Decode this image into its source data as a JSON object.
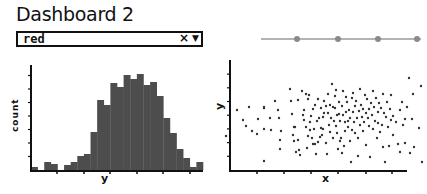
{
  "header": {
    "title": "Dashboard 2"
  },
  "controls": {
    "dropdown": {
      "value": "red",
      "clear_icon": "×",
      "caret_icon": "▼"
    },
    "slider": {
      "label": "",
      "ticks": 4,
      "value_index": 3,
      "accent": "#8a8a8a"
    }
  },
  "colors": {
    "bar": "#4d4d4d",
    "axis": "#111111",
    "point": "#333333"
  },
  "chart_data": [
    {
      "type": "bar",
      "title": "",
      "xlabel": "y",
      "ylabel": "count",
      "grid": false,
      "values": [
        3,
        0,
        8,
        6,
        0,
        5,
        8,
        14,
        16,
        38,
        70,
        65,
        87,
        83,
        95,
        91,
        96,
        85,
        88,
        74,
        52,
        37,
        21,
        12,
        3,
        8
      ]
    },
    {
      "type": "scatter",
      "title": "",
      "xlabel": "x",
      "ylabel": "y",
      "grid": false,
      "points": [
        [
          26,
          71
        ],
        [
          37,
          45
        ],
        [
          43,
          55
        ],
        [
          46,
          61
        ],
        [
          49,
          42
        ],
        [
          52,
          66
        ],
        [
          57,
          69
        ],
        [
          58,
          54
        ],
        [
          64,
          43
        ],
        [
          64,
          64
        ],
        [
          64,
          42
        ],
        [
          64,
          96
        ],
        [
          70,
          53
        ],
        [
          71,
          65
        ],
        [
          75,
          36
        ],
        [
          78,
          45
        ],
        [
          79,
          53
        ],
        [
          80,
          75
        ],
        [
          80,
          84
        ],
        [
          81,
          66
        ],
        [
          90,
          24
        ],
        [
          91,
          36
        ],
        [
          92,
          49
        ],
        [
          93,
          70
        ],
        [
          94,
          76
        ],
        [
          94,
          62
        ],
        [
          95,
          62
        ],
        [
          96,
          87
        ],
        [
          98,
          35
        ],
        [
          98,
          75
        ],
        [
          99,
          85
        ],
        [
          100,
          90
        ],
        [
          102,
          26
        ],
        [
          103,
          50
        ],
        [
          104,
          45
        ],
        [
          104,
          55
        ],
        [
          106,
          29
        ],
        [
          106,
          62
        ],
        [
          107,
          83
        ],
        [
          108,
          34
        ],
        [
          108,
          71
        ],
        [
          109,
          30
        ],
        [
          110,
          57
        ],
        [
          110,
          65
        ],
        [
          111,
          51
        ],
        [
          112,
          73
        ],
        [
          113,
          79
        ],
        [
          113,
          44
        ],
        [
          114,
          64
        ],
        [
          115,
          40
        ],
        [
          115,
          79
        ],
        [
          116,
          89
        ],
        [
          117,
          56
        ],
        [
          118,
          34
        ],
        [
          118,
          77
        ],
        [
          119,
          53
        ],
        [
          120,
          72
        ],
        [
          121,
          63
        ],
        [
          121,
          43
        ],
        [
          122,
          70
        ],
        [
          123,
          52
        ],
        [
          123,
          64
        ],
        [
          124,
          48
        ],
        [
          124,
          36
        ],
        [
          126,
          41
        ],
        [
          126,
          78
        ],
        [
          127,
          89
        ],
        [
          128,
          48
        ],
        [
          128,
          29
        ],
        [
          129,
          60
        ],
        [
          130,
          67
        ],
        [
          130,
          40
        ],
        [
          131,
          53
        ],
        [
          132,
          19
        ],
        [
          133,
          42
        ],
        [
          133,
          73
        ],
        [
          134,
          56
        ],
        [
          135,
          43
        ],
        [
          135,
          31
        ],
        [
          136,
          25
        ],
        [
          136,
          61
        ],
        [
          137,
          50
        ],
        [
          137,
          68
        ],
        [
          138,
          84
        ],
        [
          139,
          49
        ],
        [
          139,
          37
        ],
        [
          140,
          76
        ],
        [
          140,
          56
        ],
        [
          141,
          73
        ],
        [
          142,
          41
        ],
        [
          142,
          88
        ],
        [
          143,
          26
        ],
        [
          143,
          50
        ],
        [
          144,
          81
        ],
        [
          145,
          57
        ],
        [
          145,
          66
        ],
        [
          146,
          32
        ],
        [
          146,
          47
        ],
        [
          147,
          37
        ],
        [
          148,
          56
        ],
        [
          148,
          62
        ],
        [
          149,
          45
        ],
        [
          150,
          76
        ],
        [
          150,
          53
        ],
        [
          151,
          97
        ],
        [
          152,
          33
        ],
        [
          152,
          65
        ],
        [
          153,
          47
        ],
        [
          153,
          28
        ],
        [
          154,
          57
        ],
        [
          155,
          41
        ],
        [
          155,
          68
        ],
        [
          156,
          36
        ],
        [
          157,
          53
        ],
        [
          158,
          91
        ],
        [
          158,
          73
        ],
        [
          159,
          46
        ],
        [
          160,
          60
        ],
        [
          160,
          24
        ],
        [
          161,
          40
        ],
        [
          162,
          52
        ],
        [
          163,
          44
        ],
        [
          163,
          66
        ],
        [
          164,
          57
        ],
        [
          165,
          30
        ],
        [
          166,
          48
        ],
        [
          166,
          80
        ],
        [
          167,
          34
        ],
        [
          168,
          53
        ],
        [
          169,
          61
        ],
        [
          169,
          44
        ],
        [
          170,
          92
        ],
        [
          171,
          38
        ],
        [
          172,
          50
        ],
        [
          173,
          64
        ],
        [
          173,
          26
        ],
        [
          174,
          42
        ],
        [
          175,
          56
        ],
        [
          176,
          33
        ],
        [
          177,
          73
        ],
        [
          178,
          58
        ],
        [
          178,
          47
        ],
        [
          179,
          38
        ],
        [
          180,
          67
        ],
        [
          181,
          43
        ],
        [
          182,
          60
        ],
        [
          183,
          29
        ],
        [
          183,
          82
        ],
        [
          184,
          48
        ],
        [
          185,
          97
        ],
        [
          186,
          52
        ],
        [
          187,
          37
        ],
        [
          188,
          62
        ],
        [
          189,
          81
        ],
        [
          190,
          44
        ],
        [
          191,
          55
        ],
        [
          191,
          30
        ],
        [
          193,
          70
        ],
        [
          193,
          51
        ],
        [
          196,
          57
        ],
        [
          198,
          79
        ],
        [
          200,
          87
        ],
        [
          200,
          45
        ],
        [
          202,
          37
        ],
        [
          203,
          60
        ],
        [
          205,
          54
        ],
        [
          205,
          78
        ],
        [
          207,
          42
        ],
        [
          209,
          13
        ],
        [
          210,
          88
        ],
        [
          212,
          54
        ],
        [
          213,
          29
        ],
        [
          214,
          82
        ],
        [
          219,
          63
        ],
        [
          221,
          21
        ],
        [
          222,
          97
        ]
      ]
    }
  ]
}
